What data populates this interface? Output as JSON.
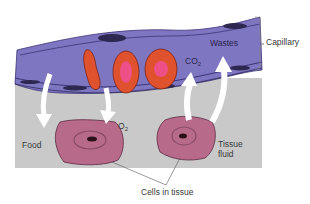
{
  "diagram": {
    "labels": {
      "capillary": "Capillary",
      "wastes": "Wastes",
      "co2_main": "CO",
      "co2_sub": "2",
      "o2_main": "O",
      "o2_sub": "2",
      "food": "Food",
      "tissue_fluid_line1": "Tissue",
      "tissue_fluid_line2": "fluid",
      "cells_in_tissue": "Cells in tissue"
    },
    "arrows": [
      {
        "name": "food-arrow",
        "direction": "capillary-to-cell"
      },
      {
        "name": "o2-arrow",
        "direction": "capillary-to-cell"
      },
      {
        "name": "co2-arrow",
        "direction": "cell-to-capillary"
      },
      {
        "name": "wastes-arrow",
        "direction": "cell-to-capillary"
      }
    ],
    "colors": {
      "capillary": "#7e76c0",
      "capillary_edge": "#3b3576",
      "tissue_fluid": "#c9c9c9",
      "cell": "#b86a8a",
      "red_blood_cell": "#e0522e",
      "rbc_center": "#ee4f86",
      "arrow": "#ffffff"
    }
  }
}
